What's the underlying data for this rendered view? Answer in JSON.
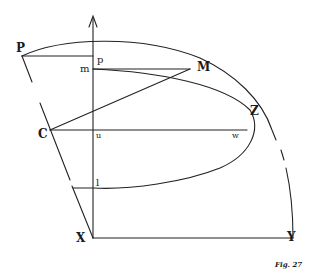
{
  "figure": {
    "caption": "Fig. 27",
    "labels": {
      "P": "P",
      "p": "p",
      "m": "m",
      "M": "M",
      "C": "C",
      "u": "u",
      "w": "w",
      "Z": "Z",
      "l": "l",
      "X": "X",
      "Y": "Y"
    },
    "stroke_color": "#222222",
    "background": "#ffffff"
  }
}
